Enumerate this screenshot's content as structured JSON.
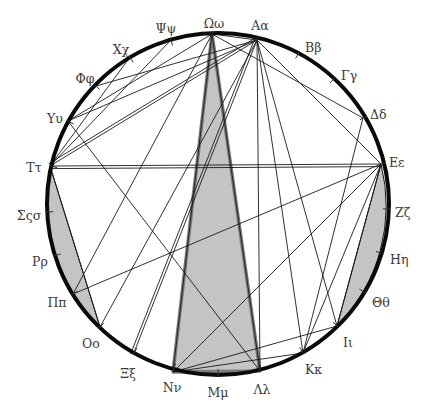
{
  "diagram": {
    "type": "circular-chord-diagram",
    "circle": {
      "cx": 218,
      "cy": 204,
      "r": 171,
      "stroke": "#0a0a0a",
      "stroke_width": 4
    },
    "colors": {
      "fill": "#c4c4c4",
      "line": "#1a1a1a",
      "label": "#3a3a3a",
      "thick_band": "#7a7a7a"
    },
    "points": [
      {
        "id": "omega",
        "label": "Ωω",
        "x": 212,
        "y": 34,
        "lx": 214,
        "ly": 24,
        "anchor": "middle"
      },
      {
        "id": "alpha",
        "label": "Αα",
        "x": 257,
        "y": 40,
        "lx": 260,
        "ly": 26,
        "anchor": "middle"
      },
      {
        "id": "beta",
        "label": "Ββ",
        "x": 297,
        "y": 56,
        "lx": 305,
        "ly": 48,
        "anchor": "start"
      },
      {
        "id": "gamma",
        "label": "Γγ",
        "x": 331,
        "y": 82,
        "lx": 341,
        "ly": 76,
        "anchor": "start"
      },
      {
        "id": "delta",
        "label": "Δδ",
        "x": 363,
        "y": 118,
        "lx": 370,
        "ly": 115,
        "anchor": "start"
      },
      {
        "id": "epsilon",
        "label": "Εε",
        "x": 381,
        "y": 164,
        "lx": 389,
        "ly": 163,
        "anchor": "start"
      },
      {
        "id": "zeta",
        "label": "Ζζ",
        "x": 388,
        "y": 209,
        "lx": 395,
        "ly": 213,
        "anchor": "start"
      },
      {
        "id": "eta",
        "label": "Ηη",
        "x": 381,
        "y": 253,
        "lx": 390,
        "ly": 260,
        "anchor": "start"
      },
      {
        "id": "theta",
        "label": "Θθ",
        "x": 364,
        "y": 292,
        "lx": 372,
        "ly": 303,
        "anchor": "start"
      },
      {
        "id": "iota",
        "label": "Ιι",
        "x": 337,
        "y": 326,
        "lx": 343,
        "ly": 343,
        "anchor": "start"
      },
      {
        "id": "kappa",
        "label": "Κκ",
        "x": 303,
        "y": 353,
        "lx": 305,
        "ly": 370,
        "anchor": "start"
      },
      {
        "id": "lambda",
        "label": "Λλ",
        "x": 260,
        "y": 371,
        "lx": 262,
        "ly": 390,
        "anchor": "middle"
      },
      {
        "id": "mu",
        "label": "Μμ",
        "x": 218,
        "y": 375,
        "lx": 218,
        "ly": 393,
        "anchor": "middle"
      },
      {
        "id": "nu",
        "label": "Νν",
        "x": 173,
        "y": 372,
        "lx": 172,
        "ly": 388,
        "anchor": "middle"
      },
      {
        "id": "xi",
        "label": "Ξξ",
        "x": 133,
        "y": 355,
        "lx": 128,
        "ly": 374,
        "anchor": "middle"
      },
      {
        "id": "omicron",
        "label": "Οο",
        "x": 100,
        "y": 327,
        "lx": 91,
        "ly": 344,
        "anchor": "middle"
      },
      {
        "id": "pi",
        "label": "Ππ",
        "x": 73,
        "y": 294,
        "lx": 57,
        "ly": 303,
        "anchor": "middle"
      },
      {
        "id": "rho",
        "label": "Ρρ",
        "x": 54,
        "y": 256,
        "lx": 40,
        "ly": 262,
        "anchor": "middle"
      },
      {
        "id": "sigma",
        "label": "Σςσ",
        "x": 47,
        "y": 212,
        "lx": 29,
        "ly": 216,
        "anchor": "middle"
      },
      {
        "id": "tau",
        "label": "Ττ",
        "x": 50,
        "y": 166,
        "lx": 34,
        "ly": 168,
        "anchor": "middle"
      },
      {
        "id": "upsilon",
        "label": "Υυ",
        "x": 68,
        "y": 121,
        "lx": 55,
        "ly": 119,
        "anchor": "middle"
      },
      {
        "id": "phi",
        "label": "Φφ",
        "x": 96,
        "y": 86,
        "lx": 85,
        "ly": 79,
        "anchor": "middle"
      },
      {
        "id": "chi",
        "label": "Χχ",
        "x": 130,
        "y": 57,
        "lx": 121,
        "ly": 50,
        "anchor": "middle"
      },
      {
        "id": "psi",
        "label": "Ψψ",
        "x": 171,
        "y": 40,
        "lx": 166,
        "ly": 29,
        "anchor": "middle"
      }
    ],
    "shaded_regions": [
      {
        "name": "central-wedge",
        "points": "212,34 173,372 260,371"
      },
      {
        "name": "left-segment",
        "arc_from": "tau",
        "arc_to": "omicron"
      },
      {
        "name": "right-segment",
        "arc_from": "epsilon",
        "arc_to": "iota"
      }
    ],
    "chords": [
      [
        "omega",
        "nu"
      ],
      [
        "omega",
        "lambda"
      ],
      [
        "omega",
        "alpha"
      ],
      [
        "omega",
        "delta"
      ],
      [
        "omega",
        "upsilon"
      ],
      [
        "alpha",
        "phi"
      ],
      [
        "alpha",
        "upsilon"
      ],
      [
        "alpha",
        "tau"
      ],
      [
        "alpha",
        "tau"
      ],
      [
        "alpha",
        "omicron"
      ],
      [
        "alpha",
        "lambda"
      ],
      [
        "alpha",
        "kappa"
      ],
      [
        "alpha",
        "epsilon"
      ],
      [
        "alpha",
        "xi"
      ],
      [
        "alpha",
        "xi"
      ],
      [
        "psi",
        "tau"
      ],
      [
        "chi",
        "tau"
      ],
      [
        "tau",
        "epsilon"
      ],
      [
        "tau",
        "epsilon"
      ],
      [
        "tau",
        "omicron"
      ],
      [
        "upsilon",
        "lambda"
      ],
      [
        "pi",
        "omega"
      ],
      [
        "delta",
        "kappa"
      ],
      [
        "epsilon",
        "nu"
      ],
      [
        "epsilon",
        "iota"
      ],
      [
        "epsilon",
        "kappa"
      ],
      [
        "epsilon",
        "pi"
      ],
      [
        "iota",
        "nu"
      ],
      [
        "kappa",
        "nu"
      ],
      [
        "iota",
        "alpha"
      ]
    ]
  }
}
